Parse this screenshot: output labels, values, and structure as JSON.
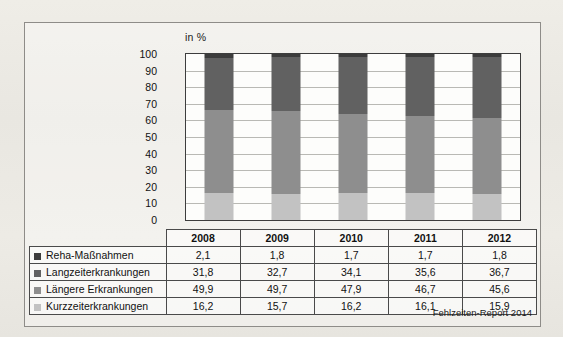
{
  "chart_data": {
    "type": "bar",
    "title": "",
    "subtitle": "",
    "unit_label": "in %",
    "xlabel": "",
    "ylabel": "in %",
    "ylim": [
      0,
      100
    ],
    "yticks": [
      0,
      10,
      20,
      30,
      40,
      50,
      60,
      70,
      80,
      90,
      100
    ],
    "grid": true,
    "stacked": true,
    "legend_position": "table-left",
    "categories": [
      "2008",
      "2009",
      "2010",
      "2011",
      "2012"
    ],
    "series": [
      {
        "name": "Kurzzeiterkrankungen",
        "values": [
          16.2,
          15.7,
          16.2,
          16.1,
          15.9
        ],
        "color": "#c2c2c2"
      },
      {
        "name": "Längere Erkrankungen",
        "values": [
          49.9,
          49.7,
          47.9,
          46.7,
          45.6
        ],
        "color": "#8e8e8e"
      },
      {
        "name": "Langzeiterkrankungen",
        "values": [
          31.8,
          32.7,
          34.1,
          35.6,
          36.7
        ],
        "color": "#616161"
      },
      {
        "name": "Reha-Maßnahmen",
        "values": [
          2.1,
          1.8,
          1.7,
          1.7,
          1.8
        ],
        "color": "#3c3c3c"
      }
    ],
    "table": {
      "header": [
        "",
        "2008",
        "2009",
        "2010",
        "2011",
        "2012"
      ],
      "rows": [
        {
          "label": "Reha-Maßnahmen",
          "swatch": "#3c3c3c",
          "values": [
            "2,1",
            "1,8",
            "1,7",
            "1,7",
            "1,8"
          ]
        },
        {
          "label": "Langzeiterkrankungen",
          "swatch": "#616161",
          "values": [
            "31,8",
            "32,7",
            "34,1",
            "35,6",
            "36,7"
          ]
        },
        {
          "label": "Längere Erkrankungen",
          "swatch": "#8e8e8e",
          "values": [
            "49,9",
            "49,7",
            "47,9",
            "46,7",
            "45,6"
          ]
        },
        {
          "label": "Kurzzeiterkrankungen",
          "swatch": "#c2c2c2",
          "values": [
            "16,2",
            "15,7",
            "16,2",
            "16,1",
            "15,9"
          ]
        }
      ]
    },
    "source": "Fehlzeiten-Report 2014"
  }
}
